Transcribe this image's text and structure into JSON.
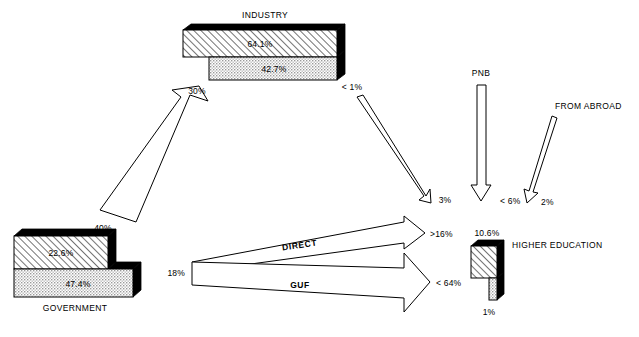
{
  "diagram": {
    "title": "",
    "nodes": [
      {
        "id": "industry",
        "label": "INDUSTRY",
        "bars": [
          {
            "id": "industry-hatched",
            "value": "64.1%",
            "pattern": "hatched"
          },
          {
            "id": "industry-stippled",
            "value": "42.7%",
            "pattern": "stippled"
          }
        ]
      },
      {
        "id": "government",
        "label": "GOVERNMENT",
        "bars": [
          {
            "id": "government-hatched",
            "value": "22.6%",
            "pattern": "hatched"
          },
          {
            "id": "government-stippled",
            "value": "47.4%",
            "pattern": "stippled"
          }
        ]
      },
      {
        "id": "higher-education",
        "label": "HIGHER EDUCATION",
        "bars": [
          {
            "id": "higher-education-hatched",
            "value": "10.6%",
            "pattern": "hatched"
          },
          {
            "id": "higher-education-stippled",
            "value": "1%",
            "pattern": "stippled"
          }
        ]
      },
      {
        "id": "pnb",
        "label": "PNB",
        "bars": []
      },
      {
        "id": "from-abroad",
        "label": "FROM ABROAD",
        "bars": []
      }
    ],
    "flows": [
      {
        "id": "government-to-industry",
        "name": "",
        "source_label": "40%",
        "target_label": "30%"
      },
      {
        "id": "industry-to-higher-education",
        "name": "",
        "source_label": "< 1%",
        "target_label": "3%"
      },
      {
        "id": "pnb-to-higher-education",
        "name": "",
        "source_label": "",
        "target_label": "< 6%"
      },
      {
        "id": "from-abroad-to-higher-education",
        "name": "",
        "source_label": "",
        "target_label": "2%"
      },
      {
        "id": "government-direct",
        "name": "DIRECT",
        "source_label": "18%",
        "target_label": ">16%"
      },
      {
        "id": "government-guf",
        "name": "GUF",
        "source_label": "",
        "target_label": "< 64%"
      }
    ],
    "colors": {
      "background": "#ffffff",
      "stroke": "#000000",
      "hatch_fill": "#ffffff",
      "stipple_fill": "#d9d9d9",
      "bevel_fill": "#000000"
    }
  }
}
